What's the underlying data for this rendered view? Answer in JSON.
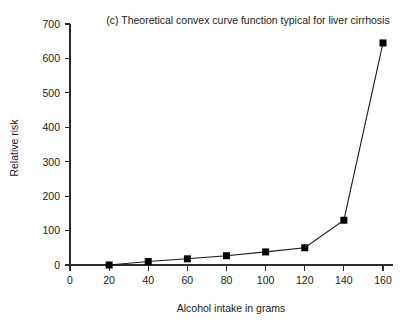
{
  "chart_data": {
    "type": "line",
    "title": "(c) Theoretical convex curve function typical for liver cirrhosis",
    "xlabel": "Alcohol intake in grams",
    "ylabel": "Relative risk",
    "x": [
      20,
      40,
      60,
      80,
      100,
      120,
      140,
      160
    ],
    "values": [
      0,
      10,
      18,
      27,
      38,
      50,
      130,
      645
    ],
    "series": [
      {
        "name": "Relative risk",
        "x": [
          20,
          40,
          60,
          80,
          100,
          120,
          140,
          160
        ],
        "values": [
          0,
          10,
          18,
          27,
          38,
          50,
          130,
          645
        ]
      }
    ],
    "xlim": [
      0,
      160
    ],
    "ylim": [
      0,
      700
    ],
    "xticks": [
      0,
      20,
      40,
      60,
      80,
      100,
      120,
      140,
      160
    ],
    "yticks": [
      0,
      100,
      200,
      300,
      400,
      500,
      600,
      700
    ],
    "xtick_labels": [
      "0",
      "20",
      "40",
      "60",
      "80",
      "100",
      "120",
      "140",
      "160"
    ],
    "ytick_labels": [
      "0",
      "100",
      "200",
      "300",
      "400",
      "500",
      "600",
      "700"
    ],
    "grid": false,
    "legend": "none",
    "marker": "square",
    "marker_color": "#000000",
    "line_color": "#1a1a1a",
    "background": "#ffffff"
  }
}
